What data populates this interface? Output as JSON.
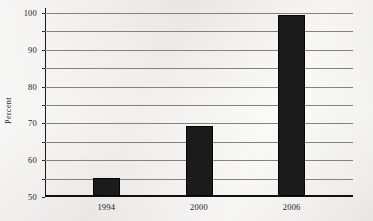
{
  "chart_data": {
    "type": "bar",
    "title": "",
    "xlabel": "",
    "ylabel": "Percent",
    "categories": [
      "1994",
      "2000",
      "2006"
    ],
    "values": [
      9.7,
      38,
      98
    ],
    "ylim": [
      0,
      100
    ],
    "yticks": [
      0,
      10,
      20,
      30,
      40,
      50,
      60,
      70,
      80,
      90,
      100
    ],
    "ytick_labels": [
      "0",
      "10",
      "20",
      "30",
      "40",
      "50",
      "60",
      "70",
      "80",
      "90",
      "100"
    ],
    "grid": "horizontal",
    "legend": "none",
    "bar_color": "#1b1b1b",
    "grid_color": "#84817e",
    "axis_color": "#111111",
    "background_color": "#f1f0ee"
  }
}
